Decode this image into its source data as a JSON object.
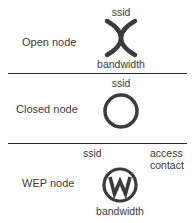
{
  "legend": {
    "rows": [
      {
        "name": "Open node",
        "symbol": "open-x",
        "labels": {
          "top": "ssid",
          "bottom": "bandwidth"
        }
      },
      {
        "name": "Closed node",
        "symbol": "circle",
        "labels": {
          "top": "ssid"
        }
      },
      {
        "name": "WEP node",
        "symbol": "circle-w",
        "symbol_letter": "W",
        "labels": {
          "top_left": "ssid",
          "top_right_line1": "access",
          "top_right_line2": "contact",
          "bottom": "bandwidth"
        }
      }
    ]
  },
  "colors": {
    "symbol_stroke": "#3b3b3b",
    "divider": "#2a2a2a",
    "text": "#3c3c3c"
  }
}
